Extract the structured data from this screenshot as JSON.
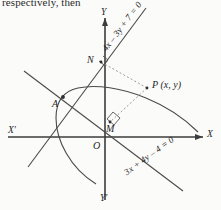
{
  "caption": {
    "text": "respectively, then"
  },
  "figure": {
    "type": "coordinate-geometry-diagram",
    "background_color": "#fbfbfa",
    "stroke_color": "#3a3a3a",
    "axes": {
      "x_positive_label": "X",
      "x_negative_label": "X′",
      "y_positive_label": "Y",
      "y_negative_label": "Y′",
      "origin_label": "O"
    },
    "points": [
      {
        "id": "A",
        "label": "A"
      },
      {
        "id": "N",
        "label": "N"
      },
      {
        "id": "M",
        "label": "M"
      },
      {
        "id": "P",
        "label": "P (x, y)"
      }
    ],
    "lines": [
      {
        "id": "line1",
        "equation": "4x – 3y + 7 = 0"
      },
      {
        "id": "line2",
        "equation": "3x + 4y – 4 = 0"
      }
    ],
    "curve": {
      "id": "parabola",
      "label": ""
    },
    "right_angles": [
      {
        "id": "angle-at-N",
        "at": "N"
      },
      {
        "id": "angle-at-M",
        "at": "M"
      }
    ],
    "dashed_segments": [
      {
        "id": "PN",
        "from": "P",
        "to": "N"
      },
      {
        "id": "PM",
        "from": "P",
        "to": "M"
      }
    ]
  }
}
